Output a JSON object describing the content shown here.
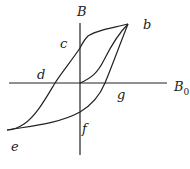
{
  "diagram": {
    "axes": {
      "vertical_label": "B",
      "horizontal_label": "B",
      "horizontal_label_sub": "0"
    },
    "points": {
      "b": "b",
      "c": "c",
      "d": "d",
      "e": "e",
      "f": "f",
      "g": "g"
    },
    "stroke_color": "#222222"
  }
}
